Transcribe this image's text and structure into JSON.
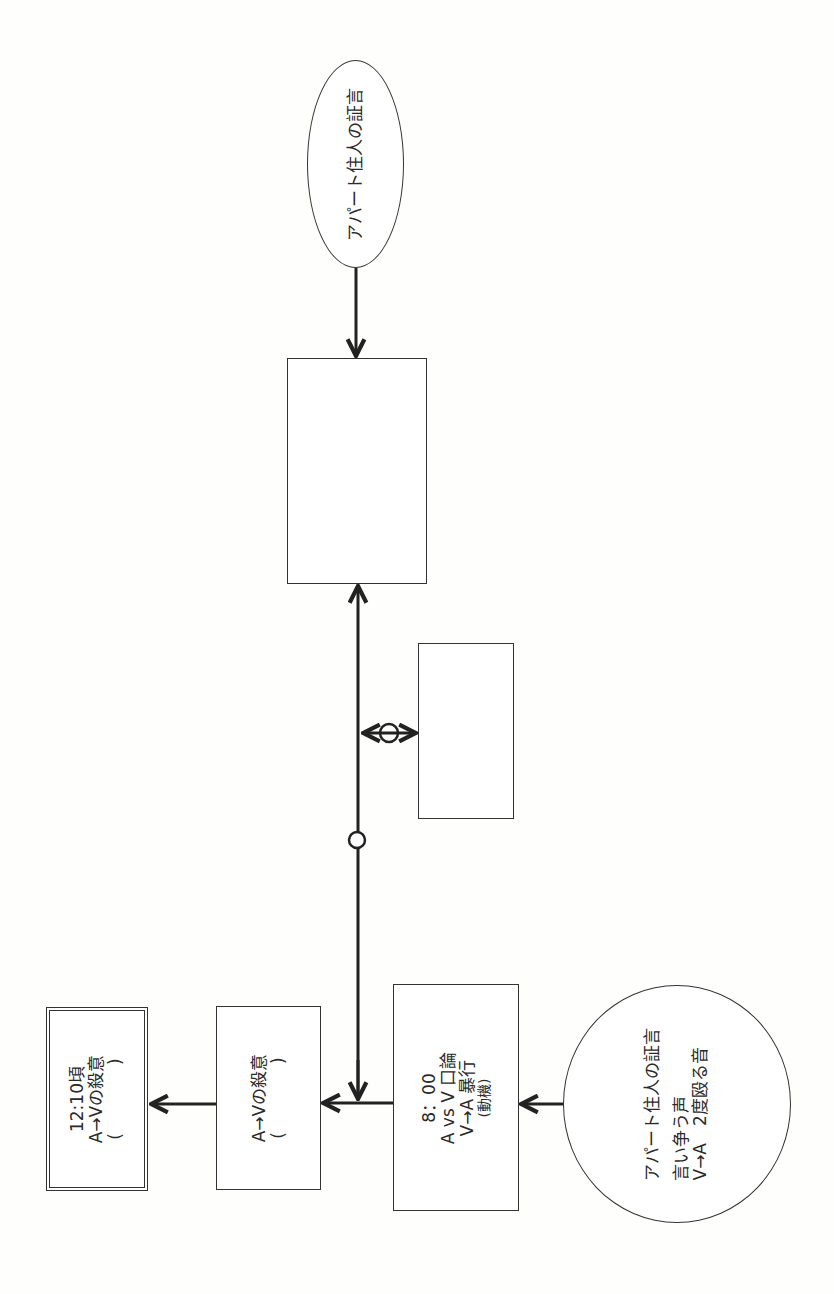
{
  "diagram": {
    "orientation": "rotated -90deg (text reads bottom-to-top)",
    "nodes": {
      "top_testimony": {
        "shape": "ellipse",
        "lines": [
          "アパート住人の証言"
        ]
      },
      "blank_main": {
        "shape": "rect",
        "lines": []
      },
      "blank_side": {
        "shape": "rect",
        "lines": []
      },
      "event_8": {
        "shape": "rect",
        "lines": [
          "8：00",
          "A vs V 口論",
          "V→A 暴行",
          "(動機)"
        ]
      },
      "intent": {
        "shape": "rect",
        "lines": [
          "A→Vの殺意",
          "(　　　　)"
        ]
      },
      "conclusion": {
        "shape": "double-rect",
        "lines": [
          "12:10頃",
          "A→Vの殺意",
          "(　　　　)"
        ]
      },
      "bottom_testimony": {
        "shape": "circle",
        "title": "アパート住人の証言",
        "lines": [
          "言い争う声",
          "V→A　2度殴る音"
        ]
      }
    },
    "markers": {
      "spine_circle": "○",
      "branch_circle": "○"
    },
    "colors": {
      "stroke": "#333333",
      "background": "#fefefc"
    }
  }
}
